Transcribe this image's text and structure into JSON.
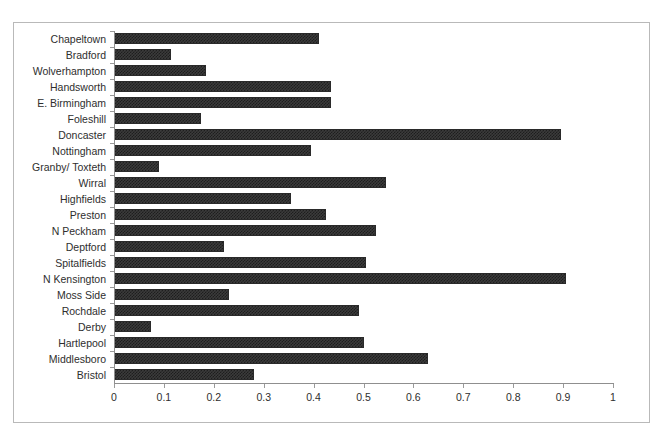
{
  "top_clipped_text": "",
  "chart_data": {
    "type": "bar",
    "orientation": "horizontal",
    "title": "",
    "subtitle": "",
    "xlabel": "",
    "ylabel": "",
    "xlim": [
      0,
      1
    ],
    "ylim": null,
    "grid": false,
    "legend": null,
    "legend_position": "none",
    "bar_color": "#3b3b3b",
    "bar_border_color": "#2a2a2a",
    "axis_color": "#8f8f8f",
    "frame_color": "#b9b9b9",
    "background": "#ffffff",
    "xticks": [
      "0",
      "0.1",
      "0.2",
      "0.3",
      "0.4",
      "0.5",
      "0.6",
      "0.7",
      "0.8",
      "0.9",
      "1"
    ],
    "xtick_values": [
      0,
      0.1,
      0.2,
      0.3,
      0.4,
      0.5,
      0.6,
      0.7,
      0.8,
      0.9,
      1
    ],
    "categories": [
      "Chapeltown",
      "Bradford",
      "Wolverhampton",
      "Handsworth",
      "E. Birmingham",
      "Foleshill",
      "Doncaster",
      "Nottingham",
      "Granby/ Toxteth",
      "Wirral",
      "Highfields",
      "Preston",
      "N Peckham",
      "Deptford",
      "Spitalfields",
      "N Kensington",
      "Moss Side",
      "Rochdale",
      "Derby",
      "Hartlepool",
      "Middlesboro",
      "Bristol"
    ],
    "values": [
      0.41,
      0.115,
      0.185,
      0.435,
      0.435,
      0.175,
      0.895,
      0.395,
      0.09,
      0.545,
      0.355,
      0.425,
      0.525,
      0.22,
      0.505,
      0.905,
      0.23,
      0.49,
      0.075,
      0.5,
      0.63,
      0.28
    ]
  }
}
